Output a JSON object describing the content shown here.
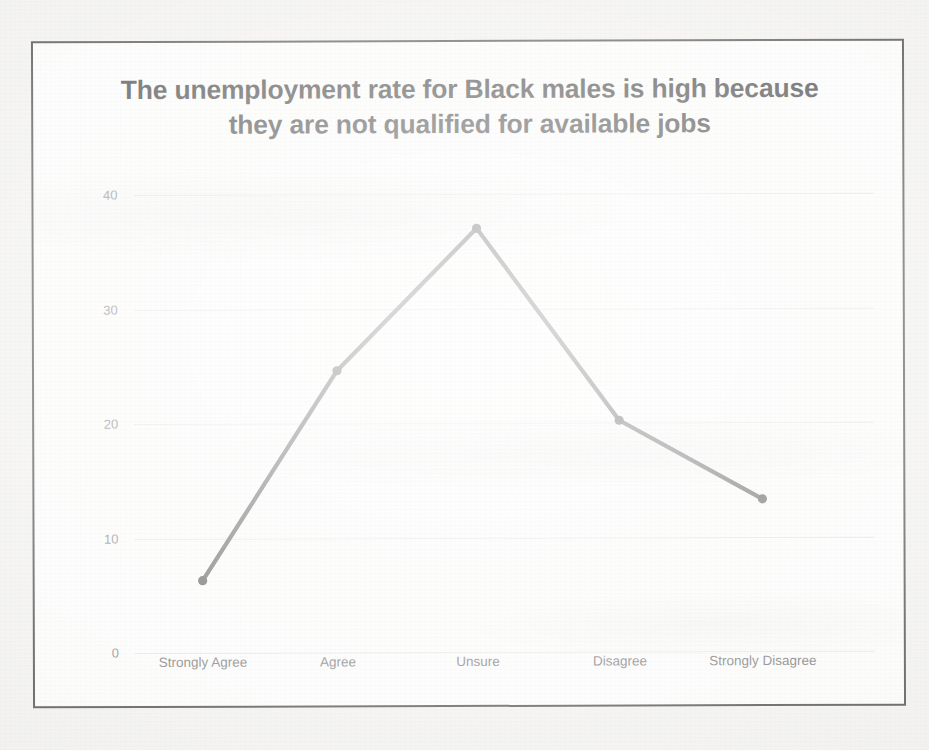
{
  "chart_data": {
    "type": "line",
    "title": "The unemployment rate for Black males is high because they are not qualified for available jobs",
    "title_lines": [
      "The unemployment rate for Black males is high because",
      "they are not qualified for available jobs"
    ],
    "categories": [
      "Strongly Agree",
      "Agree",
      "Unsure",
      "Disagree",
      "Strongly Disagree"
    ],
    "values": [
      6.3,
      24.6,
      37.0,
      20.2,
      13.3
    ],
    "series": [
      {
        "name": "Percent of respondents",
        "values": [
          6.3,
          24.6,
          37.0,
          20.2,
          13.3
        ]
      }
    ],
    "xlabel": "",
    "ylabel": "",
    "ylim": [
      0,
      42
    ],
    "yticks": [
      0,
      10,
      20,
      30,
      40
    ],
    "ytick_labels": [
      "0",
      "10",
      "20",
      "30",
      "40"
    ],
    "grid": true,
    "legend": false,
    "legend_position": "none",
    "line_color": "#4a4a4a",
    "marker": "circle",
    "marker_color": "#3d3d3d"
  },
  "colors": {
    "line": "#4a4a4a",
    "marker": "#3d3d3d",
    "grid": "#e2e1de",
    "title_text": "#1d1d1d",
    "tick_text": "#5d5d5d",
    "y_tick_text": "#6f6f6f",
    "frame_border": "#2b2b2b",
    "chart_background": "#fbfbfa",
    "page_background": "#efeeec"
  }
}
